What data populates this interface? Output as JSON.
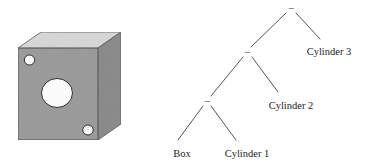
{
  "figure": {
    "solid": {
      "name": "box-with-three-holes",
      "description": "Gray shaded cube with three cylindrical holes drilled through its front face",
      "faces": {
        "top_color": "#d9d9d9",
        "front_color": "#9d9d9d",
        "side_color": "#8e8e8e",
        "outline_color": "#4a4a4a",
        "hole_fill": "#ffffff",
        "hole_outline": "#333333"
      },
      "holes": [
        {
          "label": "Cylinder 1",
          "position": "front-center",
          "size": "large"
        },
        {
          "label": "Cylinder 2",
          "position": "upper-left",
          "size": "small"
        },
        {
          "label": "Cylinder 3",
          "position": "lower-right",
          "size": "small"
        }
      ]
    },
    "tree": {
      "type": "csg-binary-tree",
      "operator_symbol": "−",
      "root": {
        "op": "−",
        "left": {
          "op": "−",
          "left": {
            "op": "−",
            "left": {
              "leaf": "Box"
            },
            "right": {
              "leaf": "Cylinder 1"
            }
          },
          "right": {
            "leaf": "Cylinder 2"
          }
        },
        "right": {
          "leaf": "Cylinder 3"
        }
      },
      "operators": [
        {
          "id": "op-root",
          "symbol": "−"
        },
        {
          "id": "op-mid",
          "symbol": "−"
        },
        {
          "id": "op-low",
          "symbol": "−"
        }
      ],
      "leaves": [
        {
          "id": "leaf-box",
          "label": "Box"
        },
        {
          "id": "leaf-cyl1",
          "label": "Cylinder 1"
        },
        {
          "id": "leaf-cyl2",
          "label": "Cylinder 2"
        },
        {
          "id": "leaf-cyl3",
          "label": "Cylinder 3"
        }
      ]
    }
  }
}
